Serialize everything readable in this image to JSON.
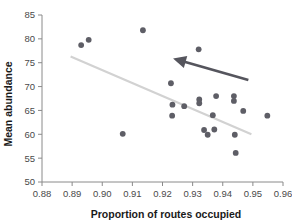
{
  "chart_data": {
    "type": "scatter",
    "title": "",
    "xlabel": "Proportion of routes occupied",
    "ylabel": "Mean abundance",
    "xlim": [
      0.88,
      0.96
    ],
    "ylim": [
      50,
      85
    ],
    "xticks": [
      "0.88",
      "0.89",
      "0.90",
      "0.91",
      "0.92",
      "0.93",
      "0.94",
      "0.95",
      "0.96"
    ],
    "xtick_values": [
      0.88,
      0.89,
      0.9,
      0.91,
      0.92,
      0.93,
      0.94,
      0.95,
      0.96
    ],
    "yticks": [
      "50",
      "55",
      "60",
      "65",
      "70",
      "75",
      "80",
      "85"
    ],
    "ytick_values": [
      50,
      55,
      60,
      65,
      70,
      75,
      80,
      85
    ],
    "grid": false,
    "legend": "none",
    "point_color": "#5e5e66",
    "trend_color": "#d2d2d2",
    "arrow_color": "#55555d",
    "points": [
      {
        "x": 0.893,
        "y": 78.7
      },
      {
        "x": 0.8955,
        "y": 79.8
      },
      {
        "x": 0.9135,
        "y": 81.8
      },
      {
        "x": 0.9068,
        "y": 60.1
      },
      {
        "x": 0.9228,
        "y": 70.7
      },
      {
        "x": 0.9233,
        "y": 66.2
      },
      {
        "x": 0.9232,
        "y": 63.9
      },
      {
        "x": 0.9272,
        "y": 65.9
      },
      {
        "x": 0.932,
        "y": 77.8
      },
      {
        "x": 0.9322,
        "y": 67.3
      },
      {
        "x": 0.9322,
        "y": 66.5
      },
      {
        "x": 0.9338,
        "y": 60.9
      },
      {
        "x": 0.935,
        "y": 59.9
      },
      {
        "x": 0.9367,
        "y": 64.0
      },
      {
        "x": 0.9372,
        "y": 61.0
      },
      {
        "x": 0.9378,
        "y": 68.0
      },
      {
        "x": 0.9437,
        "y": 68.0
      },
      {
        "x": 0.9437,
        "y": 67.0
      },
      {
        "x": 0.944,
        "y": 59.9
      },
      {
        "x": 0.9443,
        "y": 56.1
      },
      {
        "x": 0.9468,
        "y": 64.9
      },
      {
        "x": 0.9548,
        "y": 63.9
      }
    ],
    "trend_line": {
      "x_start": 0.8895,
      "y_start": 76.3,
      "x_end": 0.9495,
      "y_end": 60.0
    },
    "annotation_arrow": {
      "tail_x": 0.9485,
      "tail_y": 71.4,
      "tip_x": 0.9235,
      "tip_y": 75.9,
      "description": "arrow pointing up-left along trend"
    }
  }
}
